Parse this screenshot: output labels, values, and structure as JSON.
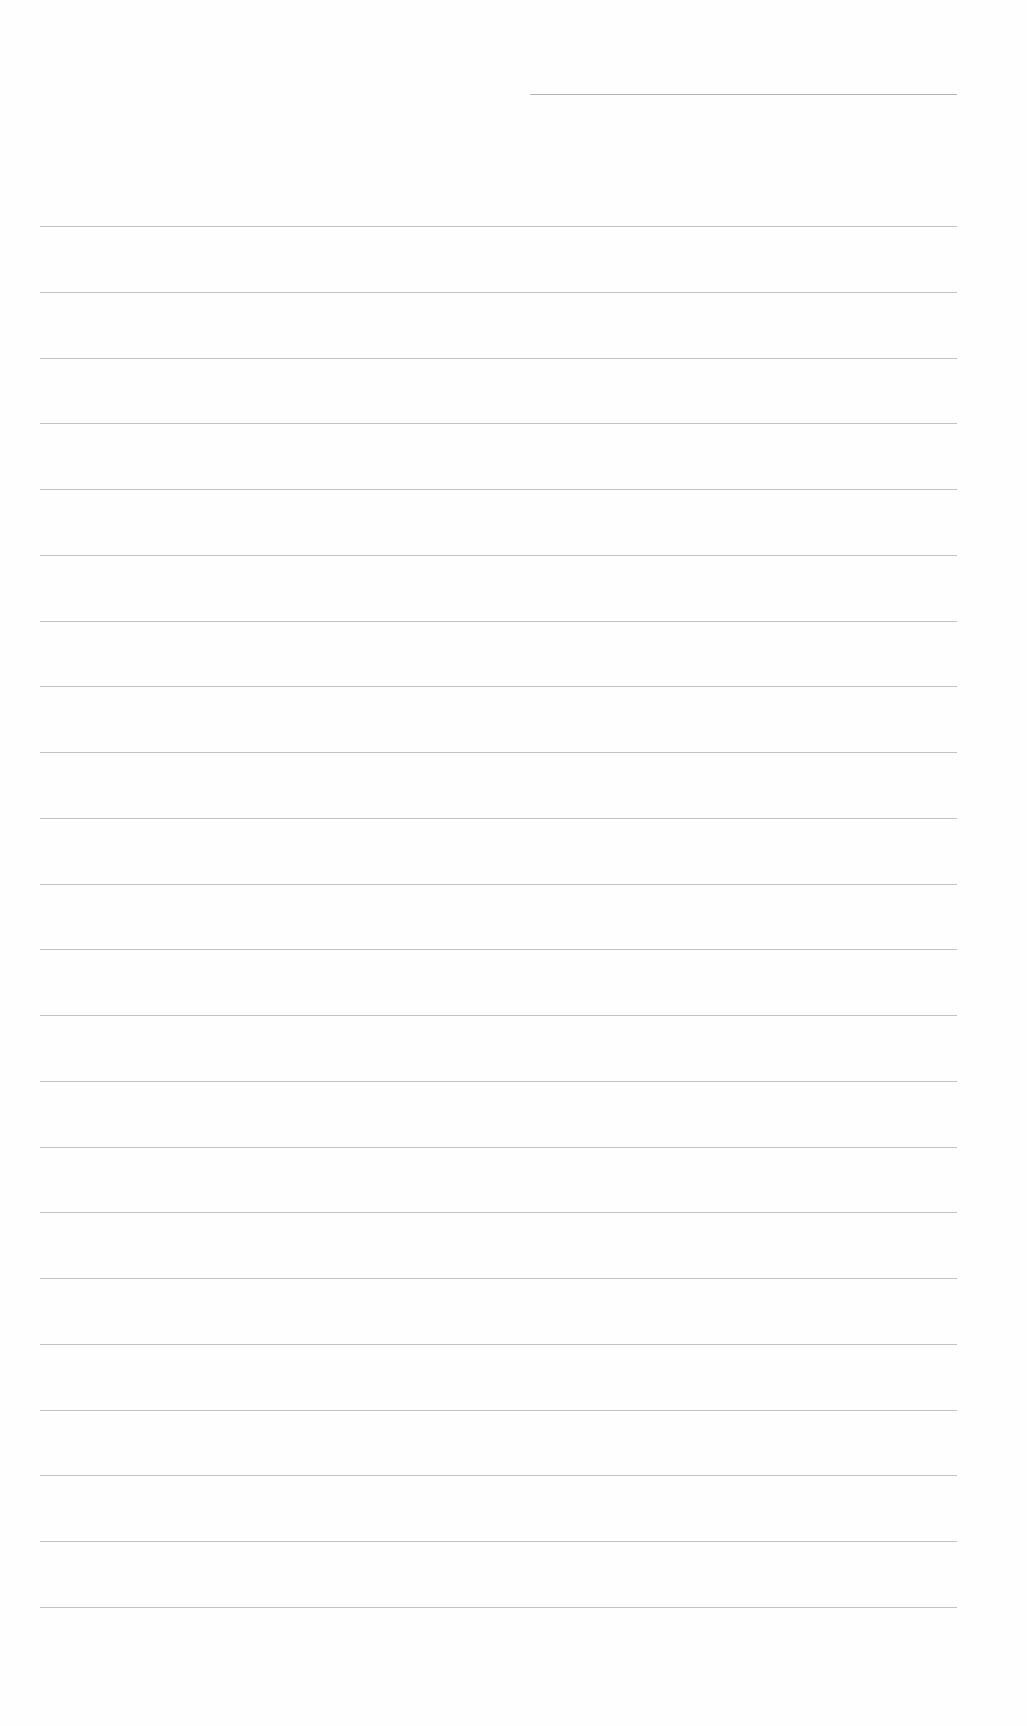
{
  "document": {
    "type": "blank-lined-page",
    "header_line": {
      "present": true
    },
    "ruled_lines": {
      "count": 22,
      "first_y": 226,
      "spacing": 65.76,
      "left": 40,
      "width": 917
    },
    "colors": {
      "background": "#fefefe",
      "line": "#a8a8a8"
    }
  }
}
